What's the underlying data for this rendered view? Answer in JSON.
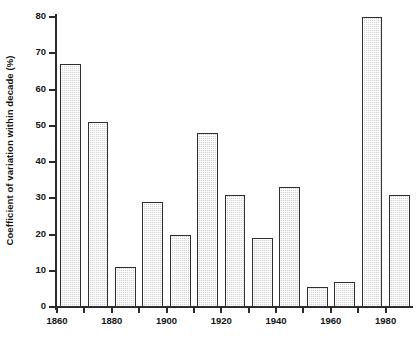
{
  "chart_data": {
    "type": "bar",
    "title": "",
    "xlabel": "",
    "ylabel": "Coefficient of variation within decade (%)",
    "categories": [
      "1860",
      "1870",
      "1880",
      "1890",
      "1900",
      "1910",
      "1920",
      "1930",
      "1940",
      "1950",
      "1960",
      "1970",
      "1980"
    ],
    "values": [
      67,
      51,
      11,
      29,
      20,
      48,
      31,
      19,
      33,
      5.5,
      7,
      80,
      31
    ],
    "ylim": [
      0,
      80
    ],
    "xlim": [
      1860,
      1990
    ],
    "ytick_labels": [
      "0",
      "10",
      "20",
      "30",
      "40",
      "50",
      "60",
      "70",
      "80"
    ],
    "ytick_values": [
      0,
      10,
      20,
      30,
      40,
      50,
      60,
      70,
      80
    ],
    "xtick_values": [
      1860,
      1870,
      1880,
      1890,
      1900,
      1910,
      1920,
      1930,
      1940,
      1950,
      1960,
      1970,
      1980
    ],
    "xtick_labels": [
      "1860",
      "",
      "1880",
      "",
      "1900",
      "",
      "1920",
      "",
      "1940",
      "",
      "1960",
      "",
      "1980"
    ],
    "grid": false,
    "legend": false,
    "bar_fill_color": "#d2d2d2",
    "bar_edge_color": "#2f2f2f",
    "axis_color": "#2b2b2b",
    "text_color": "#141414"
  }
}
